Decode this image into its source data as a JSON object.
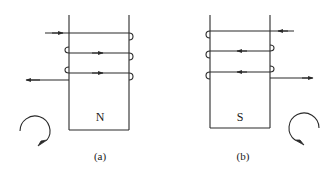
{
  "diagrams": [
    {
      "id": "a",
      "caption": "(a)",
      "pole_label": "N",
      "winding": {
        "input_wire": {
          "side": "left",
          "arrow": "right"
        },
        "turns": [
          {
            "arrow": "right",
            "loop_left": false,
            "loop_right": true
          },
          {
            "arrow": "right",
            "loop_left": true,
            "loop_right": true
          },
          {
            "arrow": "right",
            "loop_left": true,
            "loop_right": true
          }
        ],
        "output_wire": {
          "side": "left",
          "arrow": "left"
        }
      },
      "rotation_indicator": {
        "direction": "clockwise",
        "position": "bottom-left"
      }
    },
    {
      "id": "b",
      "caption": "(b)",
      "pole_label": "S",
      "winding": {
        "input_wire": {
          "side": "right",
          "arrow": "left"
        },
        "turns": [
          {
            "arrow": "left",
            "loop_left": true,
            "loop_right": false
          },
          {
            "arrow": "left",
            "loop_left": true,
            "loop_right": true
          },
          {
            "arrow": "left",
            "loop_left": true,
            "loop_right": true
          }
        ],
        "output_wire": {
          "side": "right",
          "arrow": "right"
        }
      },
      "rotation_indicator": {
        "direction": "counterclockwise",
        "position": "bottom-right"
      }
    }
  ]
}
